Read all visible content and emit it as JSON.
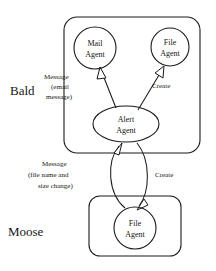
{
  "diagram": {
    "background_color": "#ffffff",
    "stroke_color": "#1a1a1a",
    "text_color": "#161616",
    "containers": [
      {
        "id": "bald",
        "label": "Bald",
        "label_x": 10,
        "label_y": 95,
        "box": {
          "x": 64,
          "y": 17,
          "width": 136,
          "height": 136,
          "radius": 13
        }
      },
      {
        "id": "moose",
        "label": "Moose",
        "label_x": 8,
        "label_y": 236,
        "box": {
          "x": 89,
          "y": 196,
          "width": 92,
          "height": 60,
          "radius": 11
        }
      }
    ],
    "nodes": [
      {
        "id": "mail-agent",
        "shape": "circle",
        "line1": "Mail",
        "line2": "Agent",
        "cx": 95,
        "cy": 48,
        "r": 21,
        "container": "bald"
      },
      {
        "id": "file-agent-bald",
        "shape": "circle",
        "line1": "File",
        "line2": "Agent",
        "cx": 170,
        "cy": 47,
        "r": 19,
        "container": "bald"
      },
      {
        "id": "alert-agent",
        "shape": "ellipse",
        "line1": "Alert",
        "line2": "Agent",
        "cx": 126,
        "cy": 124,
        "rx": 33,
        "ry": 18,
        "container": "bald"
      },
      {
        "id": "file-agent-moose",
        "shape": "circle",
        "line1": "File",
        "line2": "Agent",
        "cx": 135,
        "cy": 228,
        "r": 21,
        "container": "moose"
      }
    ],
    "edges": [
      {
        "id": "alert-to-mail",
        "from": "alert-agent",
        "to": "mail-agent",
        "arrowhead": "open-triangle",
        "label_lines": [
          "Message",
          "(email",
          "message)"
        ],
        "label_x": 44,
        "label_y": 79
      },
      {
        "id": "alert-to-file-bald",
        "from": "alert-agent",
        "to": "file-agent-bald",
        "arrowhead": "open-triangle",
        "label_lines": [
          "Create"
        ],
        "label_x": 152,
        "label_y": 88
      },
      {
        "id": "file-moose-to-alert",
        "from": "file-agent-moose",
        "to": "alert-agent",
        "arrowhead": "open-triangle",
        "label_lines": [
          "Message",
          "(file name and",
          "size change)"
        ],
        "label_x": 38,
        "label_y": 166
      },
      {
        "id": "alert-to-file-moose",
        "from": "alert-agent",
        "to": "file-agent-moose",
        "arrowhead": "open-triangle",
        "label_lines": [
          "Create"
        ],
        "label_x": 155,
        "label_y": 177
      }
    ]
  }
}
